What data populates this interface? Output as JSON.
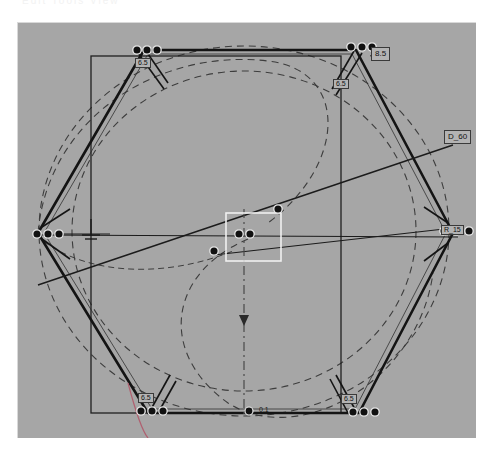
{
  "app": {
    "title": "CAD Sketch Canvas",
    "header_text": "Edit  Tools  View",
    "canvas_background": "#a6a6a6",
    "page_background": "#ffffff"
  },
  "colors": {
    "canvas_bg": "#a6a6a6",
    "geometry_stroke": "#1a1a1a",
    "construction_stroke": "#3d3d3d",
    "handle_fill": "#111111",
    "handle_stroke": "#e8e8e8",
    "selection_box": "#f0f0f0",
    "centerline": "#4a4a4a",
    "accent_magenta": "#b06070",
    "chip_bg": "#b3b3b3",
    "chip_border": "#3a3a3a"
  },
  "canvas": {
    "name": "sketch-canvas",
    "x": 17,
    "y": 22,
    "width": 458,
    "height": 415
  },
  "labels": {
    "dim_top_right": "8.5",
    "dim_diameter": "D_60",
    "dim_top_left": "6.5",
    "dim_top_right_small": "6.5",
    "dim_bottom_left": "6.5",
    "dim_bottom_right": "6.5",
    "dim_right_edge": "R_15"
  },
  "markers": {
    "bottom_center": "0.1",
    "centerline_arrow": "arrow-down"
  },
  "geometry": {
    "hexagon_vertices": [
      [
        143,
        50
      ],
      [
        355,
        50
      ],
      [
        452,
        232
      ],
      [
        358,
        412
      ],
      [
        147,
        412
      ],
      [
        37,
        232
      ]
    ],
    "outer_circle": {
      "cx": 243,
      "cy": 230,
      "r": 205
    },
    "inner_circle": {
      "cx": 243,
      "cy": 230,
      "r": 172
    },
    "frame_rect": {
      "x": 90,
      "y": 55,
      "width": 250,
      "height": 355
    },
    "selection_rect": {
      "x": 225,
      "y": 212,
      "width": 55,
      "height": 48
    }
  },
  "handle_groups": [
    {
      "name": "handles-top-left",
      "points": [
        [
          136,
          49
        ],
        [
          146,
          49
        ],
        [
          156,
          49
        ]
      ]
    },
    {
      "name": "handles-top-right",
      "points": [
        [
          350,
          46
        ],
        [
          361,
          46
        ],
        [
          371,
          46
        ]
      ]
    },
    {
      "name": "handles-right",
      "points": [
        [
          443,
          230
        ],
        [
          455,
          230
        ],
        [
          468,
          230
        ]
      ]
    },
    {
      "name": "handles-bottom-right",
      "points": [
        [
          352,
          411
        ],
        [
          363,
          411
        ],
        [
          374,
          411
        ]
      ]
    },
    {
      "name": "handles-bottom-left",
      "points": [
        [
          140,
          410
        ],
        [
          151,
          410
        ],
        [
          162,
          410
        ]
      ]
    },
    {
      "name": "handles-left",
      "points": [
        [
          36,
          233
        ],
        [
          47,
          233
        ],
        [
          58,
          233
        ]
      ]
    },
    {
      "name": "handles-center",
      "points": [
        [
          213,
          250
        ],
        [
          238,
          233
        ],
        [
          249,
          233
        ],
        [
          277,
          208
        ]
      ]
    }
  ],
  "toolbar": {
    "status": ""
  }
}
